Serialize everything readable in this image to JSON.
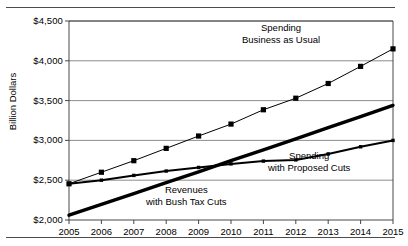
{
  "chart_data": {
    "type": "line",
    "title": "",
    "xlabel": "",
    "ylabel": "Billion Dollars",
    "x": [
      2005,
      2006,
      2007,
      2008,
      2009,
      2010,
      2011,
      2012,
      2013,
      2014,
      2015
    ],
    "xtick_labels": [
      "2005",
      "2006",
      "2007",
      "2008",
      "2009",
      "2010",
      "2011",
      "2012",
      "2013",
      "2014",
      "2015"
    ],
    "ytick_labels": [
      "$2,000",
      "$2,500",
      "$3,000",
      "$3,500",
      "$4,000",
      "$4,500"
    ],
    "ytick_values": [
      2000,
      2500,
      3000,
      3500,
      4000,
      4500
    ],
    "ylim": [
      2000,
      4500
    ],
    "xlim": [
      2005,
      2015
    ],
    "grid": "horizontal",
    "legend_position": "inline-annotations",
    "series": [
      {
        "name": "Spending Business as Usual",
        "label_lines": [
          "Spending",
          "Business as Usual"
        ],
        "marker": "square",
        "line_width": 1,
        "color": "#000000",
        "values": [
          2455,
          2600,
          2745,
          2900,
          3055,
          3205,
          3385,
          3530,
          3715,
          3930,
          4150
        ]
      },
      {
        "name": "Spending with Proposed Cuts",
        "label_lines": [
          "Spending",
          "with Proposed Cuts"
        ],
        "marker": "small-square",
        "line_width": 2,
        "color": "#000000",
        "values": [
          2455,
          2500,
          2560,
          2615,
          2660,
          2705,
          2740,
          2755,
          2830,
          2920,
          3000
        ]
      },
      {
        "name": "Revenues with Bush Tax Cuts",
        "label_lines": [
          "Revenues",
          "with Bush Tax Cuts"
        ],
        "marker": "none",
        "line_width": 3.4,
        "color": "#000000",
        "values": [
          2060,
          2195,
          2330,
          2470,
          2605,
          2745,
          2880,
          3020,
          3160,
          3300,
          3440
        ]
      }
    ]
  },
  "axis": {
    "y_title": "Billion Dollars"
  },
  "colors": {
    "ink": "#000000",
    "grid": "#808080",
    "rule": "#4c4c4c"
  }
}
